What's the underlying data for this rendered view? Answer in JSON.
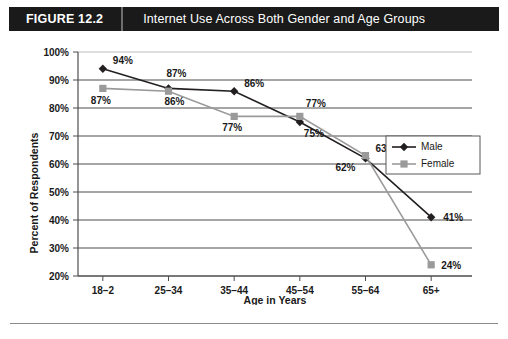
{
  "header": {
    "figure_number": "FIGURE 12.2",
    "title": "Internet Use Across Both Gender and Age Groups"
  },
  "colors": {
    "header_background": "#1a1a1a",
    "header_text": "#ffffff",
    "male_series": "#231f20",
    "female_series": "#9a9a9a",
    "gridline": "#4d4d4d",
    "page_background": "#ffffff"
  },
  "chart_data": {
    "type": "line",
    "title": "Internet Use Across Both Gender and Age Groups",
    "xlabel": "Age in Years",
    "ylabel": "Percent of Respondents",
    "categories": [
      "18–2",
      "25–34",
      "35–44",
      "45–54",
      "55–64",
      "65+"
    ],
    "ylim": [
      20,
      100
    ],
    "ytick_labels": [
      "100%",
      "90%",
      "80%",
      "70%",
      "60%",
      "50%",
      "40%",
      "30%",
      "20%"
    ],
    "ytick_values": [
      100,
      90,
      80,
      70,
      60,
      50,
      40,
      30,
      20
    ],
    "grid": true,
    "legend_position": "right-upper",
    "series": [
      {
        "name": "Male",
        "marker": "diamond",
        "color": "#231f20",
        "values": [
          94,
          87,
          86,
          75,
          62,
          41
        ],
        "data_labels": [
          "94%",
          "87%",
          "86%",
          "75%",
          "62%",
          "41%"
        ]
      },
      {
        "name": "Female",
        "marker": "square",
        "color": "#9a9a9a",
        "values": [
          87,
          86,
          77,
          77,
          63,
          24
        ],
        "data_labels": [
          "87%",
          "86%",
          "77%",
          "77%",
          "63%",
          "24%"
        ]
      }
    ]
  }
}
